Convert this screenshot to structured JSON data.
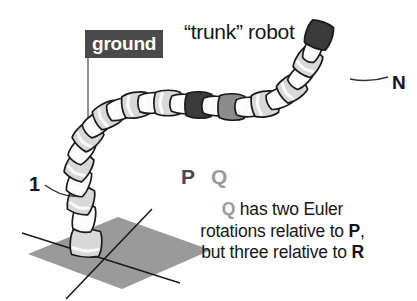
{
  "figure": {
    "title": "“trunk” robot",
    "ground_label": "ground",
    "base_label": "1",
    "tip_label": "N",
    "segment_label_p": "P",
    "segment_label_q": "Q",
    "caption": {
      "line1_lead": "Q",
      "line1_rest": " has two Euler",
      "line2_pre": "rotations relative to ",
      "line2_em": "P",
      "line2_post": ",",
      "line3_pre": "but three relative to ",
      "line3_em": "R"
    }
  },
  "colors": {
    "ground_badge_bg": "#4a4a4a",
    "ground_badge_text": "#ffffff",
    "ground_plane": "#9a9a9a",
    "segment_light": "#d8d8d8",
    "segment_joint": "#fbfbfb",
    "segment_p_dark": "#3a3a3a",
    "segment_q_gray": "#8c8c8c",
    "segment_n_dark": "#3a3a3a",
    "outline": "#1a1a1a",
    "text": "#161616",
    "text_gray": "#9a9a9a"
  },
  "diagram": {
    "type": "schematic",
    "ground_plane": {
      "shape": "parallelogram",
      "points": "28,254 118,217 211,250 122,289",
      "axis_line_1": "22,233 180,283",
      "axis_line_2": "152,209 66,299"
    },
    "ground_leader_line": {
      "from": "88,50",
      "to": "88,252"
    },
    "base_leader_line": {
      "from": "45,185",
      "to": "78,196"
    },
    "tip_leader_line": {
      "from": "350,79",
      "to": "388,77"
    },
    "segments": [
      {
        "i": 1,
        "cx": 86,
        "cy": 243,
        "len": 27,
        "w": 25,
        "rot": 4,
        "fill": "segment_light"
      },
      {
        "i": 2,
        "cx": 84,
        "cy": 218,
        "len": 18,
        "w": 25,
        "rot": 10,
        "fill": "segment_joint"
      },
      {
        "i": 3,
        "cx": 81,
        "cy": 200,
        "len": 21,
        "w": 25,
        "rot": 16,
        "fill": "segment_light"
      },
      {
        "i": 4,
        "cx": 79,
        "cy": 182,
        "len": 17,
        "w": 25,
        "rot": 22,
        "fill": "segment_joint"
      },
      {
        "i": 5,
        "cx": 79,
        "cy": 166,
        "len": 20,
        "w": 25,
        "rot": 30,
        "fill": "segment_light"
      },
      {
        "i": 6,
        "cx": 82,
        "cy": 150,
        "len": 16,
        "w": 25,
        "rot": 38,
        "fill": "segment_joint"
      },
      {
        "i": 7,
        "cx": 88,
        "cy": 136,
        "len": 20,
        "w": 25,
        "rot": 46,
        "fill": "segment_light"
      },
      {
        "i": 8,
        "cx": 97,
        "cy": 124,
        "len": 16,
        "w": 25,
        "rot": 54,
        "fill": "segment_joint"
      },
      {
        "i": 9,
        "cx": 108,
        "cy": 115,
        "len": 20,
        "w": 25,
        "rot": 62,
        "fill": "segment_light"
      },
      {
        "i": 10,
        "cx": 121,
        "cy": 109,
        "len": 16,
        "w": 25,
        "rot": 72,
        "fill": "segment_joint"
      },
      {
        "i": 11,
        "cx": 136,
        "cy": 105,
        "len": 21,
        "w": 25,
        "rot": 80,
        "fill": "segment_light"
      },
      {
        "i": 12,
        "cx": 152,
        "cy": 103,
        "len": 16,
        "w": 25,
        "rot": 86,
        "fill": "segment_joint"
      },
      {
        "i": 13,
        "cx": 168,
        "cy": 103,
        "len": 21,
        "w": 25,
        "rot": 90,
        "fill": "segment_light"
      },
      {
        "i": 14,
        "cx": 184,
        "cy": 104,
        "len": 15,
        "w": 25,
        "rot": 92,
        "fill": "segment_joint"
      },
      {
        "i": 15,
        "cx": 199,
        "cy": 105,
        "len": 22,
        "w": 25,
        "rot": 92,
        "fill": "segment_p_dark",
        "label": "P"
      },
      {
        "i": 16,
        "cx": 216,
        "cy": 106,
        "len": 15,
        "w": 25,
        "rot": 92,
        "fill": "segment_joint"
      },
      {
        "i": 17,
        "cx": 232,
        "cy": 107,
        "len": 22,
        "w": 25,
        "rot": 92,
        "fill": "segment_q_gray",
        "label": "Q"
      },
      {
        "i": 18,
        "cx": 249,
        "cy": 107,
        "len": 15,
        "w": 25,
        "rot": 88,
        "fill": "segment_joint"
      },
      {
        "i": 19,
        "cx": 265,
        "cy": 104,
        "len": 21,
        "w": 24,
        "rot": 80,
        "fill": "segment_light"
      },
      {
        "i": 20,
        "cx": 280,
        "cy": 98,
        "len": 15,
        "w": 24,
        "rot": 68,
        "fill": "segment_joint"
      },
      {
        "i": 21,
        "cx": 292,
        "cy": 88,
        "len": 20,
        "w": 24,
        "rot": 55,
        "fill": "segment_light"
      },
      {
        "i": 22,
        "cx": 301,
        "cy": 76,
        "len": 14,
        "w": 24,
        "rot": 44,
        "fill": "segment_joint"
      },
      {
        "i": 23,
        "cx": 308,
        "cy": 62,
        "len": 20,
        "w": 24,
        "rot": 32,
        "fill": "segment_light"
      },
      {
        "i": 24,
        "cx": 313,
        "cy": 49,
        "len": 12,
        "w": 24,
        "rot": 24,
        "fill": "segment_joint"
      },
      {
        "i": 25,
        "cx": 319,
        "cy": 35,
        "len": 22,
        "w": 24,
        "rot": 20,
        "fill": "segment_n_dark",
        "label": "N"
      }
    ]
  }
}
